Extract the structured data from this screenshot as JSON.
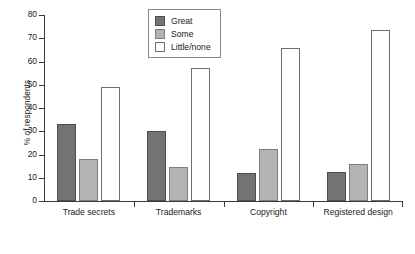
{
  "chart_data": {
    "type": "bar",
    "title": "",
    "xlabel": "",
    "ylabel": "% of respondents",
    "ylim": [
      0,
      80
    ],
    "ytick_values": [
      0,
      10,
      20,
      30,
      40,
      50,
      60,
      70,
      80
    ],
    "ytick_labels": [
      "0",
      "10",
      "20",
      "30",
      "40",
      "50",
      "60",
      "70",
      "80"
    ],
    "grid": false,
    "legend_position": "top-center",
    "categories": [
      "Trade secrets",
      "Trademarks",
      "Copyright",
      "Registered design"
    ],
    "series": [
      {
        "name": "Great",
        "color": "#737373",
        "values": [
          33,
          30,
          12,
          12.5
        ]
      },
      {
        "name": "Some",
        "color": "#b3b3b3",
        "values": [
          18,
          14.5,
          22.5,
          16
        ]
      },
      {
        "name": "Little/none",
        "color": "#ffffff",
        "values": [
          49,
          57,
          66,
          73.5
        ]
      }
    ]
  },
  "axis": {
    "y_title": "% of respondents"
  },
  "legend": {
    "items": [
      {
        "label": "Great",
        "swatch": "great"
      },
      {
        "label": "Some",
        "swatch": "some"
      },
      {
        "label": "Little/none",
        "swatch": "little"
      }
    ]
  }
}
